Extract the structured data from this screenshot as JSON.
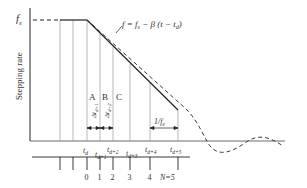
{
  "diagram": {
    "type": "stepping-motor deceleration ramp",
    "y_axis_label": "Stepping rate",
    "fs_label": "f",
    "fs_sub": "s",
    "equation": {
      "lhs": "f = f",
      "sub_s": "s",
      "mid": " − β (t − t",
      "sub_d": "d",
      "end": ")"
    },
    "regions": [
      "A",
      "B",
      "C"
    ],
    "delta_labels": [
      "Δt",
      "Δt"
    ],
    "delta_subs": [
      "d+1",
      "d+2"
    ],
    "period_label": "1/f",
    "period_sub": "e",
    "time_labels": [
      {
        "t": "t",
        "sub": "d"
      },
      {
        "t": "t",
        "sub": "d+1"
      },
      {
        "t": "t",
        "sub": "d+2"
      },
      {
        "t": "t",
        "sub": "d+3"
      },
      {
        "t": "t",
        "sub": "d+4"
      },
      {
        "t": "t",
        "sub": "d+5"
      }
    ],
    "step_labels": [
      "0",
      "1",
      "2",
      "3",
      "4",
      "N=5"
    ],
    "colors": {
      "line": "#222222",
      "grid": "#999999",
      "text": "#333333"
    }
  }
}
